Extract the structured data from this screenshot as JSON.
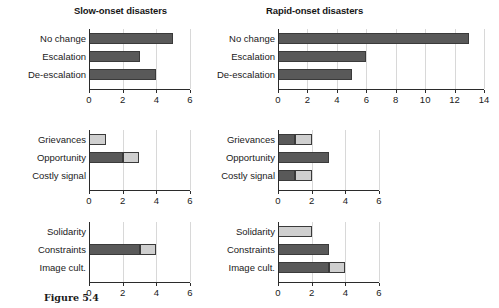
{
  "caption": "Figure 5.4",
  "colors": {
    "dark": "#595959",
    "light": "#cfcfcf",
    "axis": "#2b2b2b",
    "grid": "#d8d8d8"
  },
  "panels": {
    "left_title": "Slow-onset disasters",
    "right_title": "Rapid-onset disasters"
  },
  "chart_data": [
    {
      "id": "slow-top",
      "type": "bar",
      "orientation": "horizontal",
      "stacked": true,
      "title": "Slow-onset disasters",
      "xlabel": "",
      "ylabel": "",
      "categories": [
        "No change",
        "Escalation",
        "De-escalation"
      ],
      "series": [
        {
          "name": "dark",
          "values": [
            5,
            3,
            4
          ]
        },
        {
          "name": "light",
          "values": [
            0,
            0,
            0
          ]
        }
      ],
      "values": [
        5,
        3,
        4
      ],
      "xlim": [
        0,
        6
      ],
      "xticks": [
        0,
        2,
        4,
        6
      ],
      "xticklabels": [
        "0",
        "2",
        "4",
        "6"
      ],
      "grid": true,
      "legend": "none"
    },
    {
      "id": "rapid-top",
      "type": "bar",
      "orientation": "horizontal",
      "stacked": true,
      "title": "Rapid-onset disasters",
      "xlabel": "",
      "ylabel": "",
      "categories": [
        "No change",
        "Escalation",
        "De-escalation"
      ],
      "series": [
        {
          "name": "dark",
          "values": [
            13,
            6,
            5
          ]
        },
        {
          "name": "light",
          "values": [
            0,
            0,
            0
          ]
        }
      ],
      "values": [
        13,
        6,
        5
      ],
      "xlim": [
        0,
        14
      ],
      "xticks": [
        0,
        2,
        4,
        6,
        8,
        10,
        12,
        14
      ],
      "xticklabels": [
        "0",
        "2",
        "4",
        "6",
        "8",
        "10",
        "12",
        "14"
      ],
      "grid": true,
      "legend": "none"
    },
    {
      "id": "slow-middle",
      "type": "bar",
      "orientation": "horizontal",
      "stacked": true,
      "title": "",
      "xlabel": "",
      "ylabel": "",
      "categories": [
        "Grievances",
        "Opportunity",
        "Costly signal"
      ],
      "series": [
        {
          "name": "dark",
          "values": [
            0,
            2,
            0
          ]
        },
        {
          "name": "light",
          "values": [
            1,
            1,
            0
          ]
        }
      ],
      "values": [
        1,
        3,
        0
      ],
      "xlim": [
        0,
        6
      ],
      "xticks": [
        0,
        2,
        4,
        6
      ],
      "xticklabels": [
        "0",
        "2",
        "4",
        "6"
      ],
      "grid": true,
      "legend": "none"
    },
    {
      "id": "rapid-middle",
      "type": "bar",
      "orientation": "horizontal",
      "stacked": true,
      "title": "",
      "xlabel": "",
      "ylabel": "",
      "categories": [
        "Grievances",
        "Opportunity",
        "Costly signal"
      ],
      "series": [
        {
          "name": "dark",
          "values": [
            1,
            3,
            1
          ]
        },
        {
          "name": "light",
          "values": [
            1,
            0,
            1
          ]
        }
      ],
      "values": [
        2,
        3,
        2
      ],
      "xlim": [
        0,
        6
      ],
      "xticks": [
        0,
        2,
        4,
        6
      ],
      "xticklabels": [
        "0",
        "2",
        "4",
        "6"
      ],
      "grid": true,
      "legend": "none"
    },
    {
      "id": "slow-bottom",
      "type": "bar",
      "orientation": "horizontal",
      "stacked": true,
      "title": "",
      "xlabel": "",
      "ylabel": "",
      "categories": [
        "Solidarity",
        "Constraints",
        "Image cult."
      ],
      "series": [
        {
          "name": "dark",
          "values": [
            0,
            3,
            0
          ]
        },
        {
          "name": "light",
          "values": [
            0,
            1,
            0
          ]
        }
      ],
      "values": [
        0,
        4,
        0
      ],
      "xlim": [
        0,
        6
      ],
      "xticks": [
        0,
        2,
        4,
        6
      ],
      "xticklabels": [
        "0",
        "2",
        "4",
        "6"
      ],
      "grid": true,
      "legend": "none"
    },
    {
      "id": "rapid-bottom",
      "type": "bar",
      "orientation": "horizontal",
      "stacked": true,
      "title": "",
      "xlabel": "",
      "ylabel": "",
      "categories": [
        "Solidarity",
        "Constraints",
        "Image cult."
      ],
      "series": [
        {
          "name": "dark",
          "values": [
            0,
            3,
            3
          ]
        },
        {
          "name": "light",
          "values": [
            2,
            0,
            1
          ]
        }
      ],
      "values": [
        2,
        3,
        4
      ],
      "xlim": [
        0,
        6
      ],
      "xticks": [
        0,
        2,
        4,
        6
      ],
      "xticklabels": [
        "0",
        "2",
        "4",
        "6"
      ],
      "grid": true,
      "legend": "none"
    }
  ]
}
